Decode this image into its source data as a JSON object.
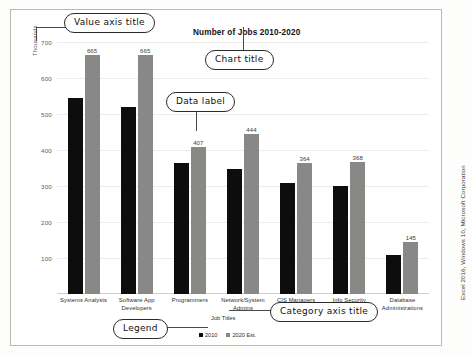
{
  "chart_data": {
    "type": "bar",
    "title": "Number of Jobs 2010-2020",
    "xlabel": "Job Titles",
    "ylabel": "Thousands",
    "ylim": [
      0,
      700
    ],
    "ytick_step": 100,
    "yticks": [
      "700",
      "600",
      "500",
      "400",
      "300",
      "200",
      "100"
    ],
    "grid": true,
    "legend_position": "bottom",
    "categories": [
      "Systems Analysts",
      "Software App Developers",
      "Programmers",
      "Network/System Admins",
      "CIS Managers",
      "Info Security Analysts",
      "Database Administrations"
    ],
    "series": [
      {
        "name": "2010",
        "color": "#0d0d0d",
        "values": [
          544,
          520,
          363,
          347,
          307,
          300,
          108
        ],
        "labels_shown": false
      },
      {
        "name": "2020 Est.",
        "color": "#888886",
        "values": [
          665,
          665,
          407,
          444,
          364,
          368,
          145
        ],
        "labels_shown": true
      }
    ],
    "data_labels": [
      "665",
      "665",
      "407",
      "444",
      "364",
      "368",
      "145"
    ]
  },
  "annotations": [
    {
      "id": "value-axis-title",
      "text": "Value axis title"
    },
    {
      "id": "chart-title",
      "text": "Chart title"
    },
    {
      "id": "data-label",
      "text": "Data label"
    },
    {
      "id": "category-axis-title",
      "text": "Category axis title"
    },
    {
      "id": "legend",
      "text": "Legend"
    }
  ],
  "credit": "Excel 2016, Windows 10, Microsoft Corporation"
}
